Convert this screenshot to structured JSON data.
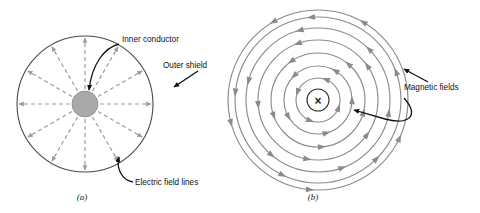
{
  "figure": {
    "background": "#ffffff",
    "panels": [
      {
        "id": "a",
        "caption": "(a)",
        "caption_x": 82,
        "caption_y": 200,
        "center": {
          "x": 85,
          "y": 104
        },
        "outer_shield": {
          "radius": 68,
          "color": "#4a4a4a",
          "stroke_width": 1.1,
          "label": "Outer shield",
          "label_x": 163,
          "label_y": 68,
          "leader": {
            "x1": 198,
            "y1": 71,
            "x2": 172,
            "y2": 88
          }
        },
        "inner_conductor": {
          "radius": 13,
          "fill": "#a9a9a9",
          "stroke": "#8e8e8e",
          "label": "Inner conductor",
          "label_x": 122,
          "label_y": 42,
          "leader_path": "M 119 44 C 104 48 92 64 89 90"
        },
        "field_lines": {
          "label": "Electric field lines",
          "label_x": 135,
          "label_y": 185,
          "leader_path": "M 133 182 C 123 180 117 170 119 158",
          "count": 12,
          "color": "#9b9b9b",
          "dash": "4,3",
          "stroke_width": 1.2,
          "inner_radius": 15,
          "outer_radius": 66,
          "angles_deg": [
            0,
            30,
            60,
            90,
            120,
            150,
            180,
            210,
            240,
            270,
            300,
            330
          ]
        }
      },
      {
        "id": "b",
        "caption": "(b)",
        "caption_x": 313,
        "caption_y": 200,
        "center": {
          "x": 318,
          "y": 100
        },
        "current_marker": {
          "symbol": "×",
          "circle_radius": 11,
          "color": "#333333",
          "description": "current into page"
        },
        "magnetic_fields": {
          "label": "Magnetic fields",
          "label_x": 404,
          "label_y": 90,
          "leader_upper": {
            "x1": 428,
            "y1": 82,
            "x2": 402,
            "y2": 68
          },
          "leader_lower_path": "M 404 98 C 420 116 408 124 386 119 L 352 110",
          "color": "#8b8b8b",
          "stroke_width": 1.15,
          "circles": [
            {
              "radius": 22,
              "arrows_deg": [
                20,
                110,
                200,
                290
              ]
            },
            {
              "radius": 34,
              "arrows_deg": [
                0,
                75,
                150,
                225,
                300
              ]
            },
            {
              "radius": 47,
              "arrows_deg": [
                15,
                85,
                160,
                235,
                310
              ]
            },
            {
              "radius": 60,
              "arrows_deg": [
                35,
                100,
                175,
                250,
                325
              ]
            },
            {
              "radius": 72,
              "arrows_deg": [
                10,
                70,
                130,
                195,
                255,
                315
              ]
            },
            {
              "radius": 83,
              "arrows_deg": [
                45,
                115,
                185,
                265,
                340
              ]
            },
            {
              "radius": 90,
              "arrows_deg": [
                25,
                95,
                165,
                240,
                300
              ]
            }
          ],
          "direction": "counterclockwise"
        }
      }
    ]
  }
}
